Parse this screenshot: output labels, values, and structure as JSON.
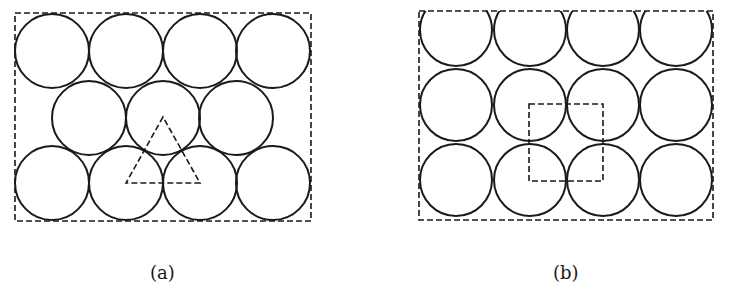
{
  "panels": [
    {
      "id": "a",
      "caption": "(a)",
      "packing": "hexagonal",
      "frame": {
        "x": 15,
        "y": 13,
        "w": 296,
        "h": 208
      },
      "radius": 37,
      "circles": [
        [
          52,
          51
        ],
        [
          126,
          51
        ],
        [
          200,
          51
        ],
        [
          273,
          51
        ],
        [
          89,
          118
        ],
        [
          163,
          118
        ],
        [
          236,
          118
        ],
        [
          52,
          183
        ],
        [
          126,
          183
        ],
        [
          200,
          183
        ],
        [
          273,
          183
        ]
      ],
      "overlay": {
        "shape": "triangle",
        "points": "163,117 126,183 200,183"
      }
    },
    {
      "id": "b",
      "caption": "(b)",
      "packing": "square",
      "frame": {
        "x": 419,
        "y": 11,
        "w": 294,
        "h": 209
      },
      "radius": 36,
      "circles": [
        [
          456,
          30
        ],
        [
          530,
          30
        ],
        [
          603,
          30
        ],
        [
          676,
          30
        ],
        [
          456,
          105
        ],
        [
          530,
          105
        ],
        [
          603,
          105
        ],
        [
          676,
          105
        ],
        [
          456,
          180
        ],
        [
          530,
          180
        ],
        [
          603,
          180
        ],
        [
          676,
          180
        ]
      ],
      "overlay": {
        "shape": "square",
        "x": 529,
        "y": 104,
        "w": 74,
        "h": 77
      }
    }
  ]
}
